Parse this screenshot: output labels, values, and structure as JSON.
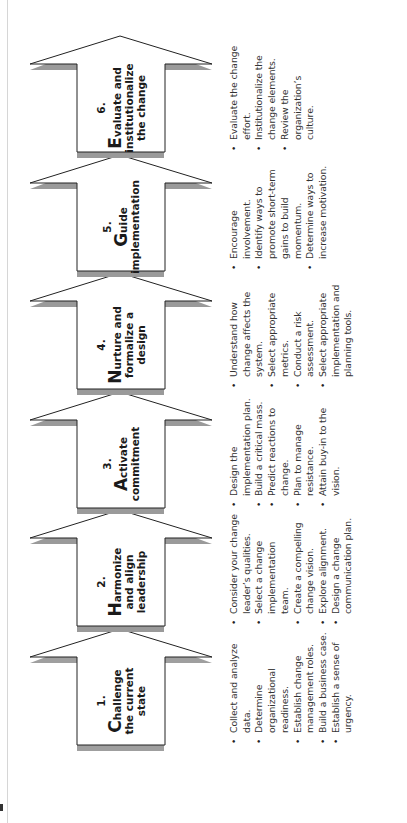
{
  "diagram": {
    "orientation": "rotated-90-ccw",
    "colors": {
      "arrow_fill": "#ffffff",
      "arrow_stroke": "#222222",
      "shadow": "#9a9a9a",
      "text": "#333333"
    },
    "steps": [
      {
        "number": "1.",
        "initial": "C",
        "title_rest": "hallenge the current state",
        "bullets": [
          "Collect and analyze data.",
          "Determine organizational readiness.",
          "Establish change management roles.",
          "Build a business case.",
          "Establish a sense of urgency."
        ]
      },
      {
        "number": "2.",
        "initial": "H",
        "title_rest": "armonize and align leadership",
        "bullets": [
          "Consider your change leader’s qualities.",
          "Select a change implementation team.",
          "Create a compelling change vision.",
          "Explore alignment.",
          "Design a change communication plan."
        ]
      },
      {
        "number": "3.",
        "initial": "A",
        "title_rest": "ctivate commitment",
        "bullets": [
          "Design the implementation plan.",
          "Build a critical mass.",
          "Predict reactions to change.",
          "Plan to manage resistance.",
          "Attain buy-in to the vision."
        ]
      },
      {
        "number": "4.",
        "initial": "N",
        "title_rest": "urture and formalize a design",
        "bullets": [
          "Understand how change affects the system.",
          "Select appropriate metrics.",
          "Conduct a risk assessment.",
          "Select appropriate implementation and planning tools."
        ]
      },
      {
        "number": "5.",
        "initial": "G",
        "title_rest": "uide implementation",
        "bullets": [
          "Encourage involvement.",
          "Identify ways to promote short-term gains to build momentum.",
          "Determine ways to increase motivation."
        ]
      },
      {
        "number": "6.",
        "initial": "E",
        "title_rest": "valuate and institutionalize the change",
        "bullets": [
          "Evaluate the change effort.",
          "Institutionalize the change elements.",
          "Review the organization’s culture."
        ]
      }
    ]
  }
}
